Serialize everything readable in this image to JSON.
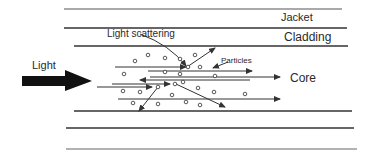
{
  "diagram": {
    "labels": {
      "jacket": "Jacket",
      "cladding": "Cladding",
      "core": "Core",
      "light": "Light",
      "light_scattering": "Light scattering",
      "particles": "Particles"
    },
    "colors": {
      "line": "#333333",
      "text": "#2a2a2a",
      "background": "#ffffff"
    }
  }
}
